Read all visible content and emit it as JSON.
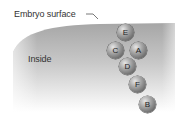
{
  "labels": {
    "surface": "Embryo surface",
    "inside": "Inside"
  },
  "cells": [
    {
      "id": "E",
      "x": 117,
      "y": 24
    },
    {
      "id": "C",
      "x": 107,
      "y": 42
    },
    {
      "id": "A",
      "x": 130,
      "y": 42
    },
    {
      "id": "D",
      "x": 119,
      "y": 58
    },
    {
      "id": "F",
      "x": 129,
      "y": 76
    },
    {
      "id": "B",
      "x": 139,
      "y": 96
    }
  ],
  "colors": {
    "region_top": "#a8a8a8",
    "region_bottom": "#ffffff",
    "text": "#333333"
  }
}
